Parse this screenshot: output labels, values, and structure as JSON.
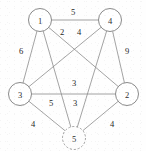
{
  "figure": {
    "width": 146,
    "height": 151,
    "background_color": "#fefefe",
    "edge_color": "#8c8c8c",
    "node_stroke_color": "#7d7d7d",
    "node_fill_color": "#ffffff",
    "label_color": "#1f1f1f"
  },
  "chart_data": {
    "type": "diagram",
    "subtype": "node-link-graph",
    "title": "",
    "directed": false,
    "weighted": true,
    "nodes": [
      {
        "id": "1",
        "label": "1",
        "x": 40,
        "y": 20,
        "r": 11.5,
        "style": "solid"
      },
      {
        "id": "4",
        "label": "4",
        "x": 110,
        "y": 20,
        "r": 11.5,
        "style": "solid"
      },
      {
        "id": "3",
        "label": "3",
        "x": 20,
        "y": 94,
        "r": 11.5,
        "style": "solid"
      },
      {
        "id": "2",
        "label": "2",
        "x": 127,
        "y": 94,
        "r": 11.5,
        "style": "solid"
      },
      {
        "id": "5",
        "label": "5",
        "x": 74,
        "y": 138,
        "r": 11.5,
        "style": "dashed"
      }
    ],
    "edges": [
      {
        "source": "1",
        "target": "4",
        "weight": 5,
        "label_x": 73,
        "label_y": 12
      },
      {
        "source": "1",
        "target": "2",
        "weight": 2,
        "label_x": 62,
        "label_y": 32
      },
      {
        "source": "4",
        "target": "3",
        "weight": 4,
        "label_x": 79,
        "label_y": 32
      },
      {
        "source": "1",
        "target": "3",
        "weight": 6,
        "label_x": 21,
        "label_y": 51
      },
      {
        "source": "4",
        "target": "2",
        "weight": 9,
        "label_x": 127,
        "label_y": 51
      },
      {
        "source": "3",
        "target": "2",
        "weight": 3,
        "label_x": 74,
        "label_y": 83
      },
      {
        "source": "1",
        "target": "5",
        "weight": 5,
        "label_x": 51,
        "label_y": 103
      },
      {
        "source": "4",
        "target": "5",
        "weight": 3,
        "label_x": 75,
        "label_y": 103
      },
      {
        "source": "3",
        "target": "5",
        "weight": 4,
        "label_x": 33,
        "label_y": 124
      },
      {
        "source": "2",
        "target": "5",
        "weight": 4,
        "label_x": 112,
        "label_y": 124
      }
    ],
    "node_count": 5,
    "edge_count": 10,
    "weights": [
      5,
      2,
      4,
      6,
      9,
      3,
      5,
      3,
      4,
      4
    ]
  }
}
